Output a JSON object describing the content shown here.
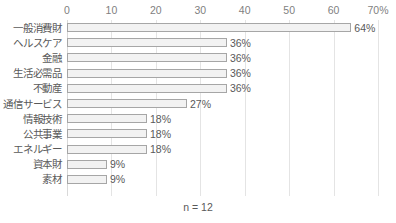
{
  "chart_data": {
    "type": "bar",
    "orientation": "horizontal",
    "title": "",
    "xlabel": "",
    "ylabel": "",
    "xlim": [
      0,
      70
    ],
    "grid": true,
    "legend": null,
    "xticks": [
      "0",
      "10",
      "20",
      "30",
      "40",
      "50",
      "60",
      "70%"
    ],
    "xtick_values": [
      0,
      10,
      20,
      30,
      40,
      50,
      60,
      70
    ],
    "categories": [
      "一般消費財",
      "ヘルスケア",
      "金融",
      "生活必需品",
      "不動産",
      "通信サービス",
      "情報技術",
      "公共事業",
      "エネルギー",
      "資本財",
      "素材"
    ],
    "values": [
      64,
      36,
      36,
      36,
      36,
      27,
      18,
      18,
      18,
      9,
      9
    ],
    "value_labels": [
      "64%",
      "36%",
      "36%",
      "36%",
      "36%",
      "27%",
      "18%",
      "18%",
      "18%",
      "9%",
      "9%"
    ],
    "annotation": "n = 12",
    "colors": {
      "bar_fill": "#f2f2f2",
      "bar_border": "#a6a6a6",
      "gridline": "#e4e4e4",
      "text": "#595959",
      "tick_text": "#7f7f7f",
      "background": "#ffffff"
    }
  }
}
